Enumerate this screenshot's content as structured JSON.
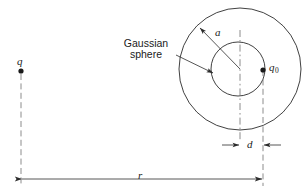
{
  "figure": {
    "type": "physics-diagram",
    "labels": {
      "gaussian_line1": "Gaussian",
      "gaussian_line2": "sphere",
      "radius_inner": "a",
      "charge_left": "q",
      "charge_test": "q",
      "charge_test_sub": "0",
      "offset": "d",
      "distance": "r"
    },
    "colors": {
      "ink": "#1a1a1a",
      "stroke": "#2b2b2b",
      "background": "#ffffff"
    },
    "geometry": {
      "outer_circle": {
        "cx": 240,
        "cy": 69,
        "r": 61
      },
      "inner_circle": {
        "cx": 238,
        "cy": 69,
        "r": 27
      },
      "charge_q": {
        "x": 21,
        "y": 71
      },
      "charge_q0": {
        "x": 263,
        "y": 70
      },
      "center_axis_x": 240,
      "charge_axis_x": 263,
      "d_dimension_y": 145,
      "r_dimension_y": 179,
      "r_span": [
        21,
        263
      ]
    }
  }
}
